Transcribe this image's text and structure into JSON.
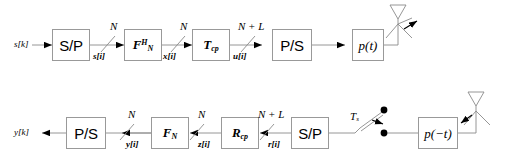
{
  "diagram": {
    "wire_color": "#808080",
    "block_border_color": "#999999",
    "text_color": "#000000"
  },
  "transmitter": {
    "input_label": "s[k]",
    "blocks": [
      {
        "id": "tx-sp",
        "label": "S/P",
        "style": "sans"
      },
      {
        "id": "tx-ifft",
        "label": "F",
        "sup": "H",
        "sub": "N",
        "style": "matrix"
      },
      {
        "id": "tx-cp",
        "label": "T",
        "sub": "cp",
        "style": "matrix"
      },
      {
        "id": "tx-ps",
        "label": "P/S",
        "style": "sans"
      },
      {
        "id": "tx-pt",
        "label": "p(t)",
        "style": "pulse"
      }
    ],
    "signals": [
      {
        "name": "s[i]"
      },
      {
        "name": "x[i]"
      },
      {
        "name": "u[i]"
      }
    ],
    "bus_widths": [
      "N",
      "N",
      "N + L"
    ],
    "antenna": "transmit-antenna"
  },
  "receiver": {
    "output_label": "y[k]",
    "blocks": [
      {
        "id": "rx-ps",
        "label": "P/S",
        "style": "sans"
      },
      {
        "id": "rx-fft",
        "label": "F",
        "sub": "N",
        "style": "matrix"
      },
      {
        "id": "rx-cp",
        "label": "R",
        "sub": "cp",
        "style": "matrix"
      },
      {
        "id": "rx-sp",
        "label": "S/P",
        "style": "sans"
      },
      {
        "id": "rx-pt",
        "label": "p(−t)",
        "style": "pulse"
      }
    ],
    "signals": [
      {
        "name": "y[i]"
      },
      {
        "name": "z[i]"
      },
      {
        "name": "r[i]"
      }
    ],
    "bus_widths": [
      "N",
      "N",
      "N + L"
    ],
    "sampler_label": "T",
    "sampler_sub": "s",
    "antenna": "receive-antenna"
  }
}
